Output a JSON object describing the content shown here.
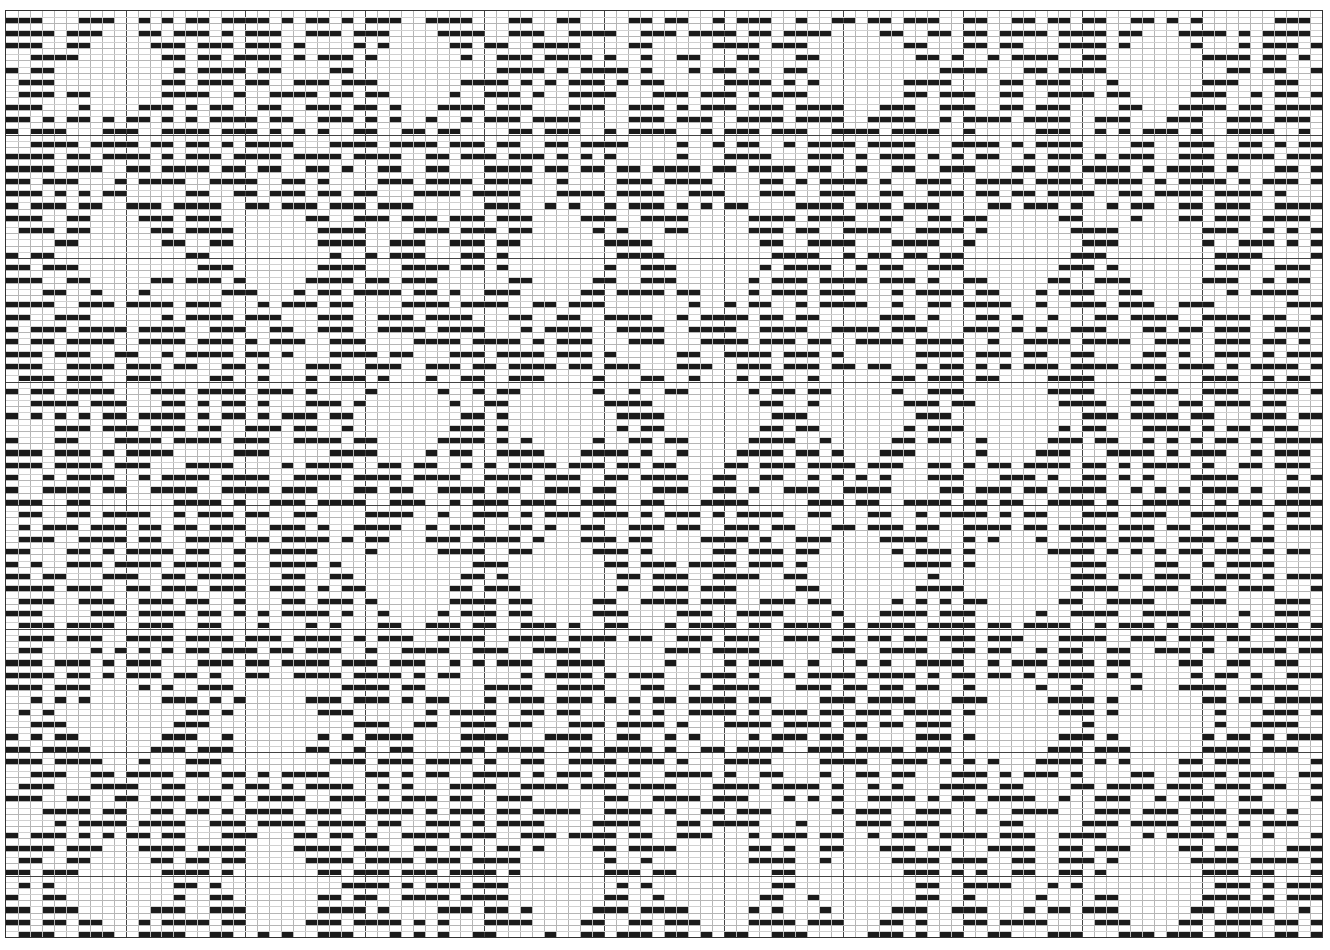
{
  "chart_data": {
    "type": "heatmap",
    "title": "",
    "grid": {
      "columns": 110,
      "rows": 75,
      "cell_width_px": 11.96,
      "cell_height_px": 12.35,
      "major_line_every": 10,
      "bar_fill_fraction_of_cell_height": 0.5
    },
    "colors": {
      "bar": "#1a1a1a",
      "background": "#ffffff",
      "minor_grid": "#b5b5b5",
      "major_grid": "#444444"
    },
    "motif": {
      "shape": "diamond",
      "radius_cells": 6,
      "fill_density_outside": 0.58,
      "centers": [
        [
          9,
          4
        ],
        [
          34,
          4
        ],
        [
          71,
          4
        ],
        [
          96,
          4
        ],
        [
          9,
          19
        ],
        [
          22,
          19
        ],
        [
          46,
          19
        ],
        [
          59,
          19
        ],
        [
          84,
          19
        ],
        [
          96,
          19
        ],
        [
          33,
          32
        ],
        [
          46,
          32
        ],
        [
          59,
          32
        ],
        [
          71,
          32
        ],
        [
          84,
          32
        ],
        [
          33,
          45
        ],
        [
          46,
          45
        ],
        [
          71,
          45
        ],
        [
          84,
          45
        ],
        [
          9,
          57
        ],
        [
          22,
          57
        ],
        [
          84,
          57
        ],
        [
          96,
          57
        ],
        [
          9,
          70
        ],
        [
          22,
          70
        ],
        [
          46,
          70
        ],
        [
          59,
          70
        ],
        [
          71,
          70
        ],
        [
          96,
          70
        ]
      ]
    }
  }
}
